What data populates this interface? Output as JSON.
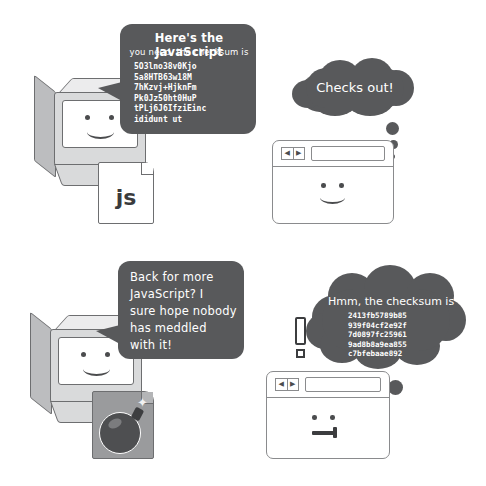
{
  "illustration": {
    "title": "Subresource integrity: checksum verification comic",
    "background_color": "#ffffff",
    "ink_color": "#6d6e70",
    "bubble_color": "#58595b"
  },
  "panels": [
    {
      "id": "top",
      "name": "honest-delivery",
      "server": {
        "name": "server-computer",
        "face": "smiling",
        "file": {
          "label": "js",
          "name": "javascript-file-page",
          "state": "clean"
        }
      },
      "speech": {
        "name": "server-speech-bubble",
        "line1": "Here's the JavaScript",
        "line2": "you need, the checksum is",
        "checksum_lines": [
          "5O3lno38v0Kjo",
          "5a8HTB63w18M",
          "7hKzvj+HjknFm",
          "Pk0Jz50ht0HuP",
          "tPLj6J6IfziEinc",
          "ididunt ut"
        ]
      },
      "browser": {
        "name": "browser-window",
        "face": "smiling",
        "url_value": "",
        "back_icon": "arrow-left-icon",
        "forward_icon": "arrow-right-icon"
      },
      "thought": {
        "name": "browser-thought-bubble",
        "text": "Checks out!"
      }
    },
    {
      "id": "bottom",
      "name": "tampered-delivery",
      "server": {
        "name": "server-computer",
        "face": "smiling",
        "file": {
          "label": "",
          "name": "bomb-file-page",
          "state": "tampered",
          "icon": "bomb-icon"
        }
      },
      "speech": {
        "name": "server-speech-bubble",
        "line1": "Back for more",
        "line2": "JavaScript? I",
        "line3": "sure hope nobody",
        "line4": "has meddled",
        "line5": "with it!"
      },
      "browser": {
        "name": "browser-window",
        "face": "unamused",
        "url_value": "",
        "back_icon": "arrow-left-icon",
        "forward_icon": "arrow-right-icon"
      },
      "thought": {
        "name": "browser-thought-bubble",
        "text": "Hmm, the checksum is",
        "checksum_lines": [
          "2413fb5789b85",
          "939f04cf2e92f",
          "7d0897fc25961",
          "9ad8b8a9ea855",
          "c7bfebaae892"
        ]
      },
      "alert": {
        "name": "exclamation-mark",
        "symbol": "!"
      }
    }
  ]
}
